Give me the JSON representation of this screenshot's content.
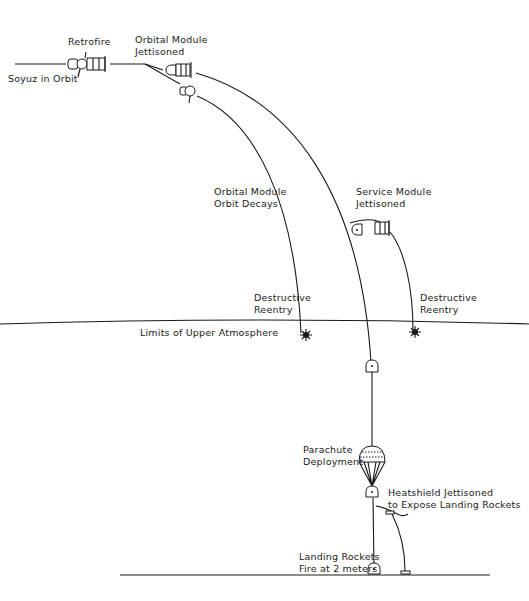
{
  "labels": {
    "soyuz_in_orbit": "Soyuz in Orbit",
    "retrofire": "Retrofire",
    "orbital_module_jettisoned_1": "Orbital Module",
    "orbital_module_jettisoned_2": "Jettisoned",
    "orbital_module_decays_1": "Orbital Module",
    "orbital_module_decays_2": "Orbit Decays",
    "service_module_jettisoned_1": "Service Module",
    "service_module_jettisoned_2": "Jettisoned",
    "destructive_reentry_left_1": "Destructive",
    "destructive_reentry_left_2": "Reentry",
    "destructive_reentry_right_1": "Destructive",
    "destructive_reentry_right_2": "Reentry",
    "upper_atmosphere": "Limits of Upper Atmosphere",
    "parachute_1": "Parachute",
    "parachute_2": "Deployment",
    "heatshield_1": "Heatshield Jettisoned",
    "heatshield_2": "to Expose Landing Rockets",
    "landing_1": "Landing Rockets",
    "landing_2": "Fire at 2 meters"
  },
  "stages": [
    "Soyuz in Orbit",
    "Retrofire",
    "Orbital Module Jettisoned",
    "Orbital Module Orbit Decays",
    "Service Module Jettisoned",
    "Destructive Reentry",
    "Limits of Upper Atmosphere",
    "Parachute Deployment",
    "Heatshield Jettisoned to Expose Landing Rockets",
    "Landing Rockets Fire at 2 meters"
  ]
}
